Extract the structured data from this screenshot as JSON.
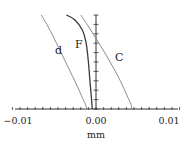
{
  "chart_data": {
    "type": "line",
    "title": "",
    "xlabel": "mm",
    "ylabel": "",
    "xlim": [
      -0.012,
      0.012
    ],
    "ylim": [
      0,
      1
    ],
    "grid": false,
    "legend": "none (inline curve labels)",
    "x_ticks": [
      "-0.01",
      "0.00",
      "0.01"
    ],
    "x_tick_values": [
      -0.01,
      0.0,
      0.01
    ],
    "x_minor_tick_step": 0.001,
    "y_axis_position": 0.0,
    "y_minor_ticks": 10,
    "series": [
      {
        "name": "d",
        "color": "#8a8a8a",
        "points": [
          [
            -0.0072,
            1.0
          ],
          [
            -0.0062,
            0.86
          ],
          [
            -0.0052,
            0.7
          ],
          [
            -0.004,
            0.5
          ],
          [
            -0.0028,
            0.3
          ],
          [
            -0.0019,
            0.14
          ],
          [
            -0.0014,
            0.05
          ],
          [
            -0.0012,
            0.0
          ]
        ]
      },
      {
        "name": "F",
        "color": "#3a3a3a",
        "points": [
          [
            -0.0039,
            1.0
          ],
          [
            -0.0028,
            0.95
          ],
          [
            -0.0018,
            0.84
          ],
          [
            -0.0013,
            0.7
          ],
          [
            -0.001,
            0.5
          ],
          [
            -0.0008,
            0.3
          ],
          [
            -0.0006,
            0.12
          ],
          [
            -0.0005,
            0.0
          ]
        ]
      },
      {
        "name": "C",
        "color": "#8a8a8a",
        "points": [
          [
            -0.002,
            1.0
          ],
          [
            -0.0007,
            0.84
          ],
          [
            0.0007,
            0.66
          ],
          [
            0.002,
            0.48
          ],
          [
            0.0032,
            0.3
          ],
          [
            0.0041,
            0.14
          ],
          [
            0.0046,
            0.05
          ],
          [
            0.0047,
            0.0
          ]
        ]
      }
    ],
    "annotations": [
      {
        "text": "d",
        "x": -0.005,
        "y": 0.62
      },
      {
        "text": "F",
        "x": -0.0023,
        "y": 0.69
      },
      {
        "text": "C",
        "x": 0.0031,
        "y": 0.55
      }
    ]
  },
  "labels": {
    "x_tick_left": "−0.01",
    "x_tick_mid": "0.00",
    "x_tick_right": "0.01",
    "x_axis_label": "mm",
    "curve_d": "d",
    "curve_f": "F",
    "curve_c": "C"
  }
}
